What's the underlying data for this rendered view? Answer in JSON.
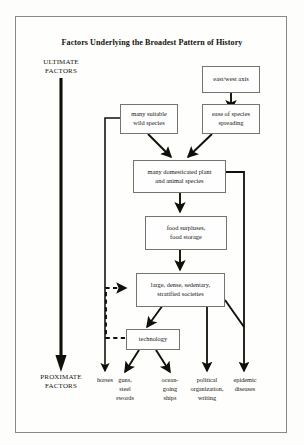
{
  "diagram": {
    "title": "Factors Underlying the Broadest Pattern of History",
    "type": "flowchart",
    "axis": {
      "top_label": "ULTIMATE\nFACTORS",
      "top_label_line1": "ULTIMATE",
      "top_label_line2": "FACTORS",
      "bottom_label_line1": "PROXIMATE",
      "bottom_label_line2": "FACTORS"
    },
    "nodes": [
      {
        "id": "east-west-axis",
        "label": "east/west axis"
      },
      {
        "id": "many-suitable-wild-species",
        "label": "many suitable\nwild species",
        "line1": "many suitable",
        "line2": "wild species"
      },
      {
        "id": "ease-of-species-spreading",
        "label": "ease of species\nspreading",
        "line1": "ease of species",
        "line2": "spreading"
      },
      {
        "id": "many-domesticated-species",
        "label": "many domesticated plant\nand animal species",
        "line1": "many domesticated plant",
        "line2": "and animal species"
      },
      {
        "id": "food-surpluses",
        "label": "food surpluses,\nfood storage",
        "line1": "food surpluses,",
        "line2": "food storage"
      },
      {
        "id": "stratified-societies",
        "label": "large, dense, sedentary,\nstratified societies",
        "line1": "large, dense, sedentary,",
        "line2": "stratified societies"
      },
      {
        "id": "technology",
        "label": "technology"
      }
    ],
    "outcomes": [
      {
        "id": "horses",
        "line1": "horses",
        "line2": "",
        "line3": ""
      },
      {
        "id": "guns-steel-swords",
        "line1": "guns,",
        "line2": "steel",
        "line3": "swords"
      },
      {
        "id": "ocean-going-ships",
        "line1": "ocean-",
        "line2": "going",
        "line3": "ships"
      },
      {
        "id": "political-organization-writing",
        "line1": "political",
        "line2": "organization,",
        "line3": "writing"
      },
      {
        "id": "epidemic-diseases",
        "line1": "epidemic",
        "line2": "diseases",
        "line3": ""
      }
    ],
    "colors": {
      "ink": "#16160f",
      "box_border": "#75756f",
      "frame_border": "#8a8a84",
      "page_background": "#fdfdfc"
    }
  }
}
